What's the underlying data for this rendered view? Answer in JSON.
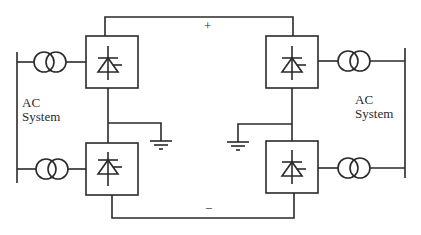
{
  "diagram": {
    "type": "HVDC back-to-back converter schematic (bipolar)",
    "dc_link": {
      "positive_label": "+",
      "negative_label": "−"
    },
    "ac_systems": [
      {
        "side": "left",
        "label_line1": "AC",
        "label_line2": "System"
      },
      {
        "side": "right",
        "label_line1": "AC",
        "label_line2": "System"
      }
    ],
    "converters": [
      {
        "id": "left-upper",
        "symbol": "thyristor-icon"
      },
      {
        "id": "right-upper",
        "symbol": "thyristor-icon"
      },
      {
        "id": "left-lower",
        "symbol": "thyristor-icon"
      },
      {
        "id": "right-lower",
        "symbol": "thyristor-icon"
      }
    ],
    "transformers": [
      {
        "id": "left-upper",
        "symbol": "transformer-icon"
      },
      {
        "id": "left-lower",
        "symbol": "transformer-icon"
      },
      {
        "id": "right-upper",
        "symbol": "transformer-icon"
      },
      {
        "id": "right-lower",
        "symbol": "transformer-icon"
      }
    ],
    "grounds": [
      {
        "id": "left-midpoint",
        "symbol": "ground-icon"
      },
      {
        "id": "right-midpoint",
        "symbol": "ground-icon"
      }
    ],
    "line_color": "#2a2a2a"
  }
}
